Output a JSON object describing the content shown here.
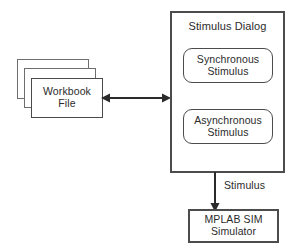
{
  "diagram": {
    "dialog": {
      "title": "Stimulus Dialog",
      "items": [
        {
          "label": "Synchronous\nStimulus",
          "name": "synchronous-stimulus"
        },
        {
          "label": "Asynchronous\nStimulus",
          "name": "asynchronous-stimulus"
        }
      ]
    },
    "workbook": {
      "label": "Workbook\nFile",
      "stack_count": 3
    },
    "simulator": {
      "label": "MPLAB SIM\nSimulator"
    },
    "connectors": {
      "workbook_dialog": {
        "label": "",
        "style": "double-headed"
      },
      "dialog_simulator": {
        "label": "Stimulus",
        "style": "single-headed-down"
      }
    },
    "colors": {
      "background": "#ffffff",
      "stroke": "#4c4c4c",
      "stroke_light": "#6e6e6e",
      "text": "#2b2b2b"
    }
  }
}
